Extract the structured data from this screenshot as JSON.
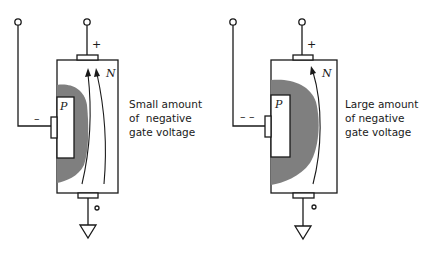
{
  "figure": {
    "diagrams": [
      {
        "id": "small",
        "drain_polarity": "+",
        "gate_polarity": "–",
        "n_label": "N",
        "p_label": "P",
        "caption": [
          "Small amount",
          "of  negative",
          "gate voltage"
        ],
        "current_arrows": 2
      },
      {
        "id": "large",
        "drain_polarity": "+",
        "gate_polarity": "– –",
        "n_label": "N",
        "p_label": "P",
        "caption": [
          "Large amount",
          "of negative",
          "gate voltage"
        ],
        "current_arrows": 1
      }
    ],
    "colors": {
      "line": "#1a1a1a",
      "depletion": "#7f7f7f",
      "background": "#ffffff"
    }
  }
}
